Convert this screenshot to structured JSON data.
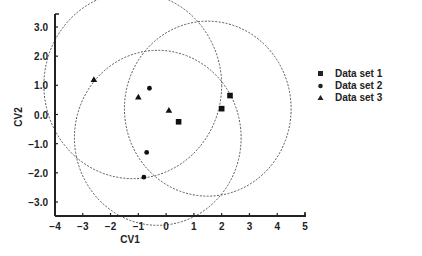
{
  "chart_data": {
    "type": "scatter",
    "title": "",
    "xlabel": "CV1",
    "ylabel": "CV2",
    "xlim": [
      -4,
      5
    ],
    "ylim": [
      -3.5,
      3.5
    ],
    "x_ticks": [
      "-4",
      "-3",
      "-2",
      "-1",
      "0",
      "1",
      "2",
      "3",
      "4",
      "5"
    ],
    "y_ticks": [
      "3.0",
      "2.0",
      "1.0",
      "0.0",
      "-1.0",
      "-2.0",
      "-3.0"
    ],
    "grid": false,
    "legend_position": "right",
    "series": [
      {
        "name": "Data set 1",
        "marker": "square",
        "points": [
          [
            0.45,
            -0.25
          ],
          [
            2.0,
            0.2
          ],
          [
            2.3,
            0.65
          ]
        ]
      },
      {
        "name": "Data set 2",
        "marker": "circle",
        "points": [
          [
            -0.6,
            0.9
          ],
          [
            -0.7,
            -1.3
          ],
          [
            -0.8,
            -2.15
          ]
        ]
      },
      {
        "name": "Data set 3",
        "marker": "triangle",
        "points": [
          [
            -2.6,
            1.2
          ],
          [
            -1.0,
            0.6
          ],
          [
            0.1,
            0.15
          ]
        ]
      }
    ],
    "confidence_circles": [
      {
        "center": [
          -1.2,
          1.0
        ],
        "radius": 3.2,
        "style": "dashed"
      },
      {
        "center": [
          1.5,
          0.2
        ],
        "radius": 3.0,
        "style": "dashed"
      },
      {
        "center": [
          -0.3,
          -0.8
        ],
        "radius": 3.0,
        "style": "dashed"
      }
    ]
  },
  "legend": {
    "items": [
      "Data set 1",
      "Data set 2",
      "Data set 3"
    ]
  }
}
